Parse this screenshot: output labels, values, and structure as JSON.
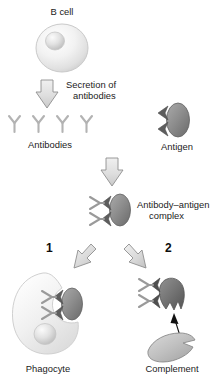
{
  "figure": {
    "background_color": "#ffffff",
    "width": 219,
    "height": 382
  },
  "labels": {
    "b_cell": "B cell",
    "secretion": "Secretion of",
    "secretion_line2": "antibodies",
    "antibodies": "Antibodies",
    "antigen": "Antigen",
    "complex_line1": "Antibody–antigen",
    "complex_line2": "complex",
    "branch_one": "1",
    "branch_two": "2",
    "phagocyte": "Phagocyte",
    "complement": "Complement"
  },
  "colors": {
    "text": "#1b1b1b",
    "cell_fill_light": "#ededed",
    "cell_fill_lighter": "#f7f7f7",
    "cell_outline": "#c9c9c9",
    "nucleus_fill": "#dcdcdc",
    "antigen_fill": "#8c8c8c",
    "antigen_fill_dark": "#6f6f6f",
    "antibody_stroke": "#b3b3b3",
    "antibody_stroke_dark": "#9a9a9a",
    "arrow_fill": "#dcdcdc",
    "arrow_outline": "#8f8f8f",
    "complement_fill": "#bdbdbd",
    "complement_outline": "#8a8a8a",
    "thin_arrow": "#111111"
  },
  "elements": {
    "b_cell": {
      "type": "cell",
      "shape": "circle-with-nucleus"
    },
    "secretion_arrow": {
      "type": "block-arrow",
      "direction": "down"
    },
    "antibodies_row": {
      "type": "antibody-group",
      "count": 4,
      "shape": "Y"
    },
    "antigen": {
      "type": "oval",
      "binding_notches": 2
    },
    "binding_arrow": {
      "type": "block-arrow",
      "direction": "down"
    },
    "complex": {
      "type": "oval-with-antibodies",
      "antibodies": 2
    },
    "branch_arrow_left": {
      "type": "block-arrow",
      "direction": "down-left"
    },
    "branch_arrow_right": {
      "type": "block-arrow",
      "direction": "down-right"
    },
    "phagocyte": {
      "type": "cell",
      "shape": "crescent-engulfing"
    },
    "complement": {
      "type": "blade",
      "attach_arrow": "thin-up"
    }
  }
}
